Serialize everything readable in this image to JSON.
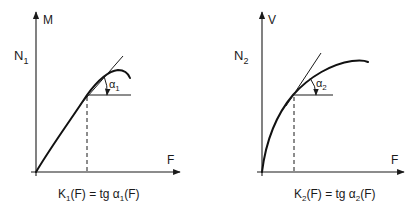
{
  "colors": {
    "ink": "#1a1a1a",
    "background": "#ffffff"
  },
  "left_graph": {
    "y_axis_label": "M",
    "y_quantity_label": "N",
    "y_quantity_sub": "1",
    "x_axis_label": "F",
    "angle_label": "α",
    "angle_sub": "1",
    "caption": {
      "k": "K",
      "k_sub": "1",
      "mid": "(F) = tg ",
      "alpha": "α",
      "alpha_sub": "1",
      "end": "(F)"
    }
  },
  "right_graph": {
    "y_axis_label": "V",
    "y_quantity_label": "N",
    "y_quantity_sub": "2",
    "x_axis_label": "F",
    "angle_label": "α",
    "angle_sub": "2",
    "caption": {
      "k": "K",
      "k_sub": "2",
      "mid": "(F) = tg ",
      "alpha": "α",
      "alpha_sub": "2",
      "end": "(F)"
    }
  }
}
